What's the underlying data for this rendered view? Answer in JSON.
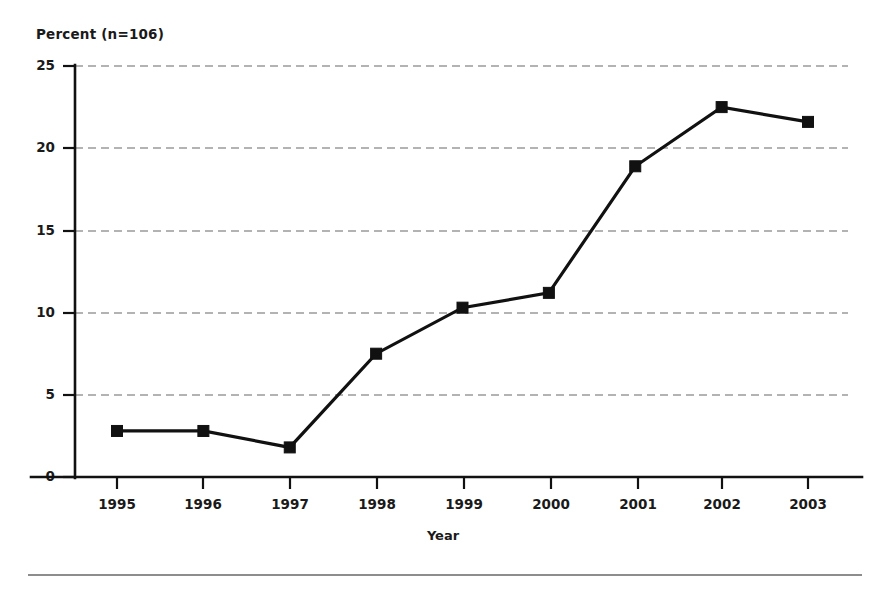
{
  "chart_data": {
    "type": "line",
    "title": "Percent (n=106)",
    "subtitle": "",
    "xlabel": "Year",
    "ylabel": "Percent (n=106)",
    "categories": [
      "1995",
      "1996",
      "1997",
      "1998",
      "1999",
      "2000",
      "2001",
      "2002",
      "2003"
    ],
    "x": [
      1995,
      1996,
      1997,
      1998,
      1999,
      2000,
      2001,
      2002,
      2003
    ],
    "values": [
      2.8,
      2.8,
      1.8,
      7.5,
      10.3,
      11.2,
      18.9,
      22.5,
      21.6
    ],
    "series": [
      {
        "name": "Percent",
        "values": [
          2.8,
          2.8,
          1.8,
          7.5,
          10.3,
          11.2,
          18.9,
          22.5,
          21.6
        ]
      }
    ],
    "ylim": [
      0,
      25
    ],
    "yticks": [
      0,
      5,
      10,
      15,
      20,
      25
    ],
    "ytick_labels": [
      "0",
      "5",
      "10",
      "15",
      "20",
      "25"
    ],
    "xtick_labels": [
      "1995",
      "1996",
      "1997",
      "1998",
      "1999",
      "2000",
      "2001",
      "2002",
      "2003"
    ],
    "grid": "horizontal-dashed",
    "legend": "none",
    "marker": "square",
    "line_color": "#111111",
    "marker_color": "#111111",
    "grid_color": "#9a9a9a",
    "axis_color": "#111111",
    "background_color": "#ffffff"
  },
  "labels": {
    "title": "Percent (n=106)",
    "x_axis_title": "Year"
  }
}
